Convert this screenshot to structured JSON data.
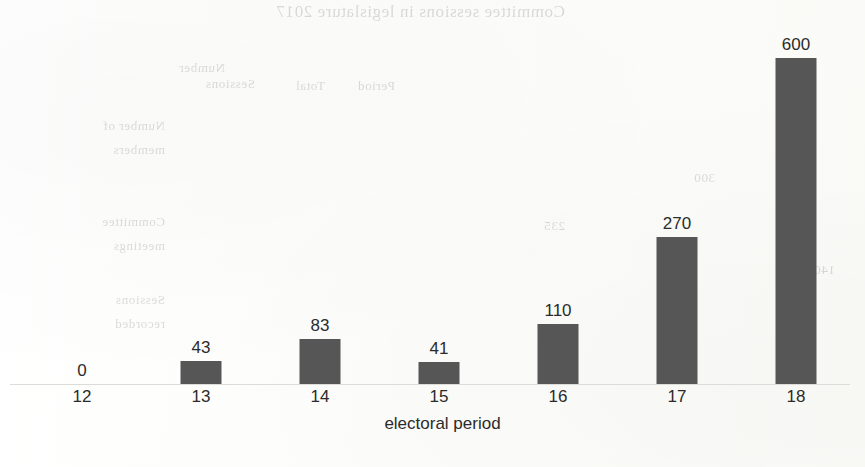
{
  "page": {
    "background_color": "#fdfdfc",
    "ink_color": "#2b2b2b"
  },
  "chart_data": {
    "type": "bar",
    "title": "",
    "subtitle": "",
    "xlabel": "electoral period",
    "ylabel": "",
    "categories": [
      "12",
      "13",
      "14",
      "15",
      "16",
      "17",
      "18"
    ],
    "values": [
      0,
      43,
      83,
      41,
      110,
      270,
      600
    ],
    "data_labels": [
      "0",
      "43",
      "83",
      "41",
      "110",
      "270",
      "600"
    ],
    "series": [
      {
        "name": "",
        "values": [
          0,
          43,
          83,
          41,
          110,
          270,
          600
        ],
        "color": "#565656"
      }
    ],
    "ylim": [
      0,
      600
    ],
    "grid": false,
    "y_axis_visible": false,
    "x_axis_visible": true,
    "axis_color": "#dcdcd8",
    "legend": false,
    "legend_position": "none",
    "bar_color": "#565656",
    "orientation": "vertical"
  },
  "ghost_text": {
    "note": "mirrored bleed-through from the reverse side of the scanned page",
    "lines": [
      {
        "text": "Committee sessions in legislature 2017",
        "x": 300,
        "y": 2,
        "size": 17
      },
      {
        "text": "Number",
        "x": 640,
        "y": 60,
        "size": 13
      },
      {
        "text": "Period",
        "x": 470,
        "y": 78,
        "size": 13
      },
      {
        "text": "Total",
        "x": 540,
        "y": 78,
        "size": 13
      },
      {
        "text": "Sessions",
        "x": 610,
        "y": 76,
        "size": 13
      },
      {
        "text": "Number of",
        "x": 700,
        "y": 118,
        "size": 13
      },
      {
        "text": "members",
        "x": 700,
        "y": 142,
        "size": 13
      },
      {
        "text": "Committee",
        "x": 700,
        "y": 214,
        "size": 13
      },
      {
        "text": "meetings",
        "x": 700,
        "y": 238,
        "size": 13
      },
      {
        "text": "Sessions",
        "x": 700,
        "y": 292,
        "size": 13
      },
      {
        "text": "recorded",
        "x": 700,
        "y": 316,
        "size": 13
      },
      {
        "text": "300",
        "x": 150,
        "y": 170,
        "size": 13
      },
      {
        "text": "235",
        "x": 300,
        "y": 218,
        "size": 13
      },
      {
        "text": "420",
        "x": 60,
        "y": 152,
        "size": 13
      },
      {
        "text": "1400",
        "x": 30,
        "y": 262,
        "size": 13
      }
    ]
  }
}
